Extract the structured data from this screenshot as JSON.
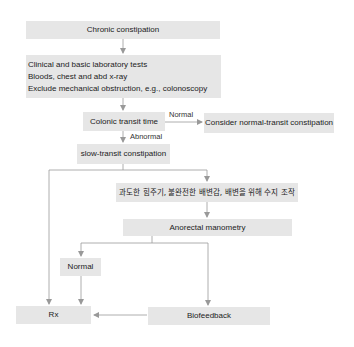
{
  "diagram": {
    "type": "flowchart",
    "colors": {
      "box_fill": "#e6e6e6",
      "line": "#999999",
      "text": "#222222"
    },
    "nodes": {
      "chronic": {
        "label": "Chronic constipation"
      },
      "tests": {
        "lines": [
          "Clinical and basic laboratory tests",
          "Bloods, chest and abd x-ray",
          "Exclude mechanical obstruction, e.g., colonoscopy"
        ]
      },
      "colonic": {
        "label": "Colonic transit time"
      },
      "normal_transit": {
        "label": "Consider normal-transit constipation"
      },
      "slow_transit": {
        "label": "slow-transit constipation"
      },
      "symptoms": {
        "label": "과도한 힘주기, 불완전한 배변감, 배변을 위해 수지 조작"
      },
      "manometry": {
        "label": "Anorectal manometry"
      },
      "normal": {
        "label": "Normal"
      },
      "rx": {
        "label": "Rx"
      },
      "biofeedback": {
        "label": "Biofeedback"
      }
    },
    "edge_labels": {
      "normal": "Normal",
      "abnormal": "Abnormal"
    },
    "edges": [
      {
        "from": "chronic",
        "to": "tests"
      },
      {
        "from": "tests",
        "to": "colonic"
      },
      {
        "from": "colonic",
        "to": "normal_transit",
        "label": "Normal"
      },
      {
        "from": "colonic",
        "to": "slow_transit",
        "label": "Abnormal"
      },
      {
        "from": "slow_transit",
        "to": "rx"
      },
      {
        "from": "slow_transit",
        "to": "symptoms"
      },
      {
        "from": "symptoms",
        "to": "manometry"
      },
      {
        "from": "manometry",
        "to": "normal"
      },
      {
        "from": "manometry",
        "to": "biofeedback"
      },
      {
        "from": "normal",
        "to": "rx"
      },
      {
        "from": "biofeedback",
        "to": "rx"
      }
    ]
  }
}
